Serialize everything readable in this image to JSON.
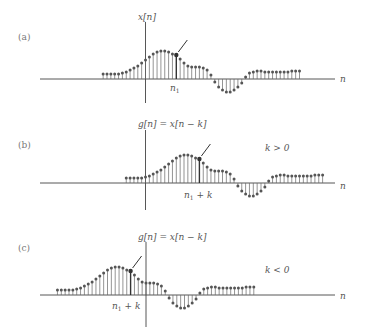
{
  "figure": {
    "panels": [
      {
        "id": "a",
        "label": "(a)",
        "signal_label": "x[n]",
        "marker_label": "n",
        "marker_sub": "1",
        "marker_suffix": "",
        "condition": "",
        "axis_label": "n",
        "shift": 0
      },
      {
        "id": "b",
        "label": "(b)",
        "signal_label": "g[n] = x[n − k]",
        "marker_label": "n",
        "marker_sub": "1",
        "marker_suffix": " + k",
        "condition": "k > 0",
        "axis_label": "n",
        "shift": 6
      },
      {
        "id": "c",
        "label": "(c)",
        "signal_label": "g[n] = x[n − k]",
        "marker_label": "n",
        "marker_sub": "1",
        "marker_suffix": " + k",
        "condition": "k < 0",
        "axis_label": "n",
        "shift": -12
      }
    ],
    "signal": {
      "start_n": -11,
      "highlight_n": 8,
      "values": [
        5,
        5,
        5,
        5,
        5,
        6,
        7,
        9,
        11,
        13,
        16,
        19,
        22,
        25,
        27,
        28,
        28,
        27,
        25,
        24,
        20,
        16,
        13,
        12,
        12,
        12,
        11,
        9,
        4,
        -3,
        -8,
        -11,
        -13,
        -13,
        -11,
        -8,
        -4,
        2,
        6,
        7,
        8,
        8,
        7,
        7,
        7,
        7,
        7,
        7,
        7,
        8,
        8,
        8
      ]
    },
    "style": {
      "stem_color": "#666666",
      "marker_color": "#555555",
      "axis_color": "#444444",
      "spacing_px": 3.85
    }
  }
}
